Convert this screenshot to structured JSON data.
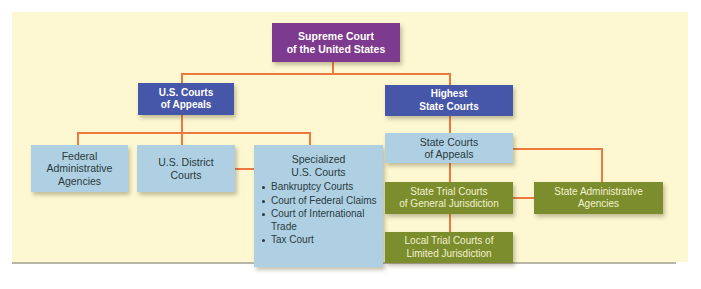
{
  "diagram": {
    "title": "",
    "colors": {
      "background": "#fdf8d2",
      "connector": "#ec7a3f",
      "supreme": "#7d3a8e",
      "appellate_top": "#4656a8",
      "federal_lower": "#aed0e2",
      "state_trial": "#7b8d2c"
    },
    "nodes": {
      "supreme_court": {
        "lines": [
          "Supreme Court",
          "of the United States"
        ]
      },
      "us_courts_of_appeals": {
        "lines": [
          "U.S. Courts",
          "of Appeals"
        ]
      },
      "highest_state_courts": {
        "lines": [
          "Highest",
          "State Courts"
        ]
      },
      "federal_admin_agencies": {
        "lines": [
          "Federal",
          "Administrative",
          "Agencies"
        ]
      },
      "us_district_courts": {
        "lines": [
          "U.S. District",
          "Courts"
        ]
      },
      "specialized_us_courts": {
        "lines": [
          "Specialized",
          "U.S. Courts"
        ],
        "items": [
          "Bankruptcy Courts",
          "Court of Federal Claims",
          "Court of International Trade",
          "Tax Court"
        ]
      },
      "state_courts_of_appeals": {
        "lines": [
          "State Courts",
          "of Appeals"
        ]
      },
      "state_trial_general": {
        "lines": [
          "State Trial Courts",
          "of General Jurisdiction"
        ]
      },
      "state_admin_agencies": {
        "lines": [
          "State Administrative",
          "Agencies"
        ]
      },
      "local_trial_limited": {
        "lines": [
          "Local Trial Courts of",
          "Limited Jurisdiction"
        ]
      }
    },
    "edges": [
      [
        "supreme_court",
        "us_courts_of_appeals"
      ],
      [
        "supreme_court",
        "highest_state_courts"
      ],
      [
        "us_courts_of_appeals",
        "federal_admin_agencies"
      ],
      [
        "us_courts_of_appeals",
        "us_district_courts"
      ],
      [
        "us_courts_of_appeals",
        "specialized_us_courts"
      ],
      [
        "us_district_courts",
        "specialized_us_courts"
      ],
      [
        "highest_state_courts",
        "state_courts_of_appeals"
      ],
      [
        "state_courts_of_appeals",
        "state_trial_general"
      ],
      [
        "state_courts_of_appeals",
        "state_admin_agencies"
      ],
      [
        "state_trial_general",
        "state_admin_agencies"
      ],
      [
        "state_trial_general",
        "local_trial_limited"
      ]
    ]
  }
}
